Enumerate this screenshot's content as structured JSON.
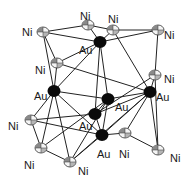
{
  "diagram": {
    "type": "crystal-structure",
    "atoms": [
      {
        "id": "ni1",
        "element": "Ni",
        "label": "Ni",
        "x": 43,
        "y": 32,
        "lx": 22,
        "ly": 32
      },
      {
        "id": "ni2",
        "element": "Ni",
        "label": "Ni",
        "x": 88,
        "y": 25,
        "lx": 80,
        "ly": 16
      },
      {
        "id": "ni3",
        "element": "Ni",
        "label": "Ni",
        "x": 113,
        "y": 30,
        "lx": 108,
        "ly": 19
      },
      {
        "id": "ni4",
        "element": "Ni",
        "label": "Ni",
        "x": 158,
        "y": 30,
        "lx": 164,
        "ly": 35
      },
      {
        "id": "ni5",
        "element": "Ni",
        "label": "Ni",
        "x": 57,
        "y": 63,
        "lx": 35,
        "ly": 70
      },
      {
        "id": "au1",
        "element": "Au",
        "label": "Au",
        "x": 100,
        "y": 42,
        "lx": 79,
        "ly": 50
      },
      {
        "id": "ni6",
        "element": "Ni",
        "label": "Ni",
        "x": 155,
        "y": 75,
        "lx": 164,
        "ly": 79
      },
      {
        "id": "au2",
        "element": "Au",
        "label": "Au",
        "x": 54,
        "y": 91,
        "lx": 34,
        "ly": 96
      },
      {
        "id": "au3",
        "element": "Au",
        "label": "Au",
        "x": 108,
        "y": 99,
        "lx": 115,
        "ly": 107
      },
      {
        "id": "au4",
        "element": "Au",
        "label": "Au",
        "x": 95,
        "y": 114,
        "lx": 79,
        "ly": 126
      },
      {
        "id": "au5",
        "element": "Au",
        "label": "Au",
        "x": 150,
        "y": 92,
        "lx": 156,
        "ly": 97
      },
      {
        "id": "ni7",
        "element": "Ni",
        "label": "Ni",
        "x": 31,
        "y": 120,
        "lx": 8,
        "ly": 126
      },
      {
        "id": "au6",
        "element": "Au",
        "label": "Au",
        "x": 102,
        "y": 135,
        "lx": 97,
        "ly": 154
      },
      {
        "id": "ni8",
        "element": "Ni",
        "label": "Ni",
        "x": 125,
        "y": 133,
        "lx": 119,
        "ly": 154
      },
      {
        "id": "ni9",
        "element": "Ni",
        "label": "Ni",
        "x": 41,
        "y": 148,
        "lx": 24,
        "ly": 165
      },
      {
        "id": "ni10",
        "element": "Ni",
        "label": "Ni",
        "x": 70,
        "y": 162,
        "lx": 78,
        "ly": 171
      },
      {
        "id": "ni11",
        "element": "Ni",
        "label": "Ni",
        "x": 158,
        "y": 150,
        "lx": 170,
        "ly": 158
      }
    ],
    "bonds": [
      [
        "ni1",
        "ni2"
      ],
      [
        "ni1",
        "au1"
      ],
      [
        "ni1",
        "ni5"
      ],
      [
        "ni1",
        "au2"
      ],
      [
        "ni2",
        "ni3"
      ],
      [
        "ni2",
        "au1"
      ],
      [
        "ni3",
        "ni4"
      ],
      [
        "ni3",
        "au1"
      ],
      [
        "ni3",
        "au5"
      ],
      [
        "ni4",
        "ni6"
      ],
      [
        "ni4",
        "au1"
      ],
      [
        "ni5",
        "au1"
      ],
      [
        "ni5",
        "au2"
      ],
      [
        "ni5",
        "au5"
      ],
      [
        "au1",
        "au3"
      ],
      [
        "au1",
        "au4"
      ],
      [
        "au1",
        "au2"
      ],
      [
        "ni6",
        "au5"
      ],
      [
        "ni6",
        "ni11"
      ],
      [
        "ni6",
        "au4"
      ],
      [
        "au2",
        "au3"
      ],
      [
        "au2",
        "ni7"
      ],
      [
        "au2",
        "ni9"
      ],
      [
        "au2",
        "ni10"
      ],
      [
        "au2",
        "au6"
      ],
      [
        "au3",
        "au4"
      ],
      [
        "au3",
        "au5"
      ],
      [
        "au3",
        "au6"
      ],
      [
        "au3",
        "ni10"
      ],
      [
        "au4",
        "au5"
      ],
      [
        "au4",
        "au6"
      ],
      [
        "au4",
        "ni7"
      ],
      [
        "au5",
        "ni8"
      ],
      [
        "au5",
        "au6"
      ],
      [
        "au5",
        "ni11"
      ],
      [
        "ni7",
        "ni9"
      ],
      [
        "ni7",
        "au6"
      ],
      [
        "ni9",
        "ni10"
      ],
      [
        "ni9",
        "au3"
      ],
      [
        "ni10",
        "au6"
      ],
      [
        "ni10",
        "au5"
      ],
      [
        "au6",
        "ni8"
      ],
      [
        "ni8",
        "ni11"
      ]
    ],
    "colors": {
      "au": "#0a0a0a",
      "ni_fill": "#f4f4f4",
      "ni_shade": "#8a8a8a",
      "bond": "#222222"
    }
  }
}
